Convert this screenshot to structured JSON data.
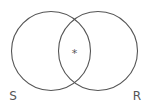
{
  "diagram": {
    "type": "venn",
    "sets": [
      {
        "id": "S",
        "label": "S"
      },
      {
        "id": "R",
        "label": "R"
      }
    ],
    "intersection_marker": "*",
    "shaded_regions": [],
    "colors": {
      "stroke": "#555555",
      "background": "#ffffff"
    }
  }
}
